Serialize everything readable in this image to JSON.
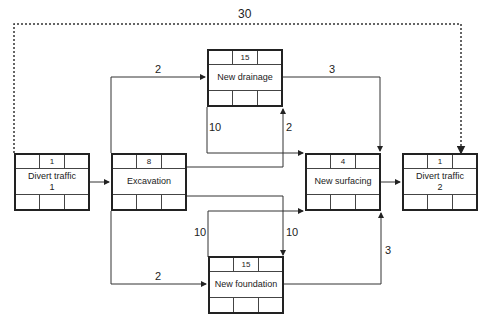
{
  "diagram": {
    "type": "activity-on-node network",
    "nodes": [
      {
        "id": "divert1",
        "name": "Divert traffic\n1",
        "duration": "1"
      },
      {
        "id": "excavation",
        "name": "Excavation",
        "duration": "8"
      },
      {
        "id": "drainage",
        "name": "New drainage",
        "duration": "15"
      },
      {
        "id": "surfacing",
        "name": "New surfacing",
        "duration": "4"
      },
      {
        "id": "divert2",
        "name": "Divert traffic\n2",
        "duration": "1"
      },
      {
        "id": "foundation",
        "name": "New foundation",
        "duration": "15"
      }
    ],
    "edge_labels": {
      "divert1_to_divert2": "30",
      "excavation_to_drainage_top": "2",
      "drainage_to_surfacing": "3",
      "drainage_to_surfacing_ss": "10",
      "excavation_to_drainage_finish": "2",
      "excavation_to_foundation_finish": "10",
      "foundation_to_surfacing_ss": "10",
      "excavation_to_foundation": "2",
      "foundation_to_surfacing": "3"
    }
  }
}
